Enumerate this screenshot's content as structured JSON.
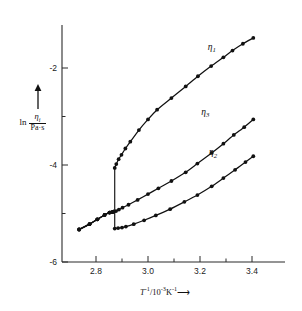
{
  "figure": {
    "background_color": "#ffffff",
    "ink_color": "#111111"
  },
  "axes": {
    "x_label_prefix": "T",
    "x_label_exponent": "-1",
    "x_label_middle": "/10",
    "x_label_exponent2": "-3",
    "x_label_unit": "K",
    "x_label_unit_exponent": "-1",
    "x_label_arrow": "⟶",
    "x_label_full": "T⁻¹/10⁻³K⁻¹ ⟶",
    "y_label_prefix": "ln",
    "y_label_numerator": "η",
    "y_label_numerator_sub": "i",
    "y_label_denominator": "Pa·s",
    "y_label_full": "ln ηᵢ/(Pa·s)",
    "y_label_arrow": "↑"
  },
  "chart_data": {
    "type": "line",
    "title": "",
    "subtitle": "",
    "xlabel": "T⁻¹/10⁻³K⁻¹",
    "ylabel": "ln ηᵢ/(Pa·s)",
    "xlim": [
      2.72,
      3.44
    ],
    "ylim": [
      -6.0,
      -1.2
    ],
    "x_ticks": [
      2.8,
      3.0,
      3.2,
      3.4
    ],
    "x_tick_labels": [
      "2.8",
      "3.0",
      "3.2",
      "3.4"
    ],
    "x_minor_ticks": [
      2.9,
      3.1,
      3.3
    ],
    "y_ticks": [
      -2,
      -4,
      -6
    ],
    "y_tick_labels": [
      "-2",
      "-4",
      "-6"
    ],
    "y_minor_ticks": [
      -3,
      -5
    ],
    "grid": false,
    "legend_position": "inline-annotation",
    "transition_x": 2.87,
    "markers": "filled-circle",
    "series": [
      {
        "name": "η₁",
        "label": "η",
        "label_sub": "1",
        "label_x": 3.23,
        "label_y": -1.62,
        "x": [
          2.735,
          2.775,
          2.805,
          2.833,
          2.852,
          2.862,
          2.868,
          2.872,
          2.878,
          2.887,
          2.898,
          2.913,
          2.932,
          2.965,
          3.0,
          3.035,
          3.09,
          3.145,
          3.192,
          3.243,
          3.29,
          3.325,
          3.365,
          3.405
        ],
        "y": [
          -5.33,
          -5.22,
          -5.12,
          -5.03,
          -4.98,
          -4.97,
          -4.96,
          -4.06,
          -3.98,
          -3.88,
          -3.79,
          -3.66,
          -3.52,
          -3.28,
          -3.06,
          -2.86,
          -2.62,
          -2.38,
          -2.17,
          -1.96,
          -1.78,
          -1.64,
          -1.5,
          -1.38
        ]
      },
      {
        "name": "η₃",
        "label": "η",
        "label_sub": "3",
        "label_x": 3.205,
        "label_y": -2.96,
        "x": [
          2.735,
          2.775,
          2.805,
          2.833,
          2.852,
          2.862,
          2.868,
          2.877,
          2.888,
          2.902,
          2.925,
          2.96,
          3.0,
          3.04,
          3.09,
          3.145,
          3.19,
          3.245,
          3.29,
          3.33,
          3.37,
          3.405
        ],
        "y": [
          -5.33,
          -5.22,
          -5.12,
          -5.03,
          -4.98,
          -4.97,
          -4.96,
          -4.95,
          -4.92,
          -4.88,
          -4.82,
          -4.72,
          -4.6,
          -4.48,
          -4.33,
          -4.15,
          -3.97,
          -3.75,
          -3.56,
          -3.38,
          -3.22,
          -3.06
        ]
      },
      {
        "name": "η₂",
        "label": "η",
        "label_sub": "2",
        "label_x": 3.235,
        "label_y": -3.8,
        "x": [
          2.735,
          2.775,
          2.805,
          2.833,
          2.852,
          2.862,
          2.868,
          2.872,
          2.885,
          2.9,
          2.915,
          2.945,
          2.985,
          3.03,
          3.085,
          3.14,
          3.19,
          3.245,
          3.29,
          3.335,
          3.375,
          3.405
        ],
        "y": [
          -5.33,
          -5.22,
          -5.12,
          -5.03,
          -4.98,
          -4.97,
          -4.96,
          -5.31,
          -5.3,
          -5.29,
          -5.27,
          -5.22,
          -5.14,
          -5.04,
          -4.91,
          -4.76,
          -4.62,
          -4.44,
          -4.27,
          -4.1,
          -3.94,
          -3.82
        ]
      }
    ],
    "discontinuity": {
      "x": 2.872,
      "y_top": -4.06,
      "y_bottom": -5.31,
      "description": "vertical jump connecting branches at transition"
    }
  }
}
